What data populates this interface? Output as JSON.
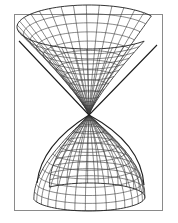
{
  "figure": {
    "frame": {
      "x": 14,
      "y": 14,
      "width": 149,
      "height": 197,
      "stroke": "#8a8a8a"
    },
    "apex": {
      "x": 89,
      "y": 115
    },
    "line_color": "#3a3a3a",
    "edge_color": "#1e1e1e",
    "upper_nappe": {
      "radial_lines": 28,
      "rings": 11,
      "height_scale": 1.0,
      "gap_start_deg": -30,
      "gap_end_deg": 40
    },
    "lower_nappe": {
      "radial_lines": 28,
      "rings": 11,
      "height_scale": 1.0,
      "gap_start_deg": 170,
      "gap_end_deg": 225
    }
  }
}
